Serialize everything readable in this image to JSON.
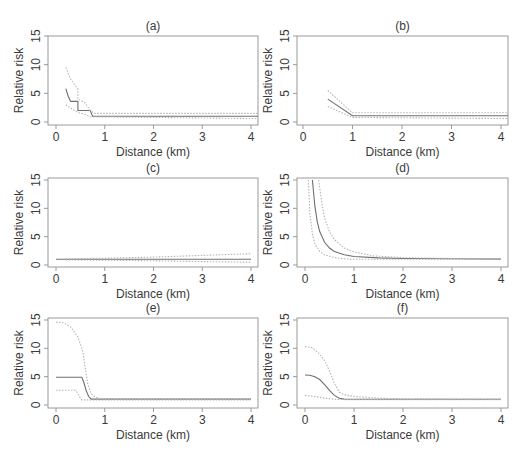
{
  "figure": {
    "xlabel": "Distance (km)",
    "ylabel": "Relative risk",
    "colors": {
      "axis": "#9a9a9a",
      "estimate": "#6f6f6f",
      "ci": "#b4b4b4",
      "text": "#3a3a3a"
    }
  },
  "chart_data": [
    {
      "panel": "(a)",
      "type": "line",
      "title": "(a)",
      "xlabel": "Distance (km)",
      "ylabel": "Relative risk",
      "xlim": [
        0,
        4
      ],
      "ylim": [
        0,
        15
      ],
      "xticks": [
        0,
        1,
        2,
        3,
        4
      ],
      "yticks": [
        0,
        5,
        10,
        15
      ],
      "grid": false,
      "series": [
        {
          "name": "estimate",
          "style": "solid",
          "x": [
            0.2,
            0.25,
            0.3,
            0.45,
            0.45,
            0.7,
            0.75,
            4.2
          ],
          "y": [
            5.8,
            4.5,
            3.6,
            3.6,
            2.0,
            2.0,
            1.0,
            1.0
          ]
        },
        {
          "name": "upper CI",
          "style": "dotted",
          "x": [
            0.2,
            0.3,
            0.45,
            0.45,
            0.6,
            0.7,
            0.8,
            4.2
          ],
          "y": [
            9.5,
            7.5,
            5.7,
            4.0,
            3.3,
            2.0,
            1.5,
            1.5
          ]
        },
        {
          "name": "lower CI",
          "style": "dotted",
          "x": [
            0.2,
            0.3,
            0.45,
            0.6,
            0.7,
            4.2
          ],
          "y": [
            3.0,
            2.4,
            1.7,
            1.3,
            0.9,
            0.6
          ]
        }
      ]
    },
    {
      "panel": "(b)",
      "type": "line",
      "title": "(b)",
      "xlabel": "Distance (km)",
      "ylabel": "Relative risk",
      "xlim": [
        0,
        4
      ],
      "ylim": [
        0,
        15
      ],
      "xticks": [
        0,
        1,
        2,
        3,
        4
      ],
      "yticks": [
        0,
        5,
        10,
        15
      ],
      "grid": false,
      "series": [
        {
          "name": "estimate",
          "style": "solid",
          "x": [
            0.5,
            1.0,
            4.2
          ],
          "y": [
            4.0,
            1.1,
            1.1
          ]
        },
        {
          "name": "upper CI",
          "style": "dotted",
          "x": [
            0.5,
            1.0,
            4.2
          ],
          "y": [
            5.5,
            1.6,
            1.6
          ]
        },
        {
          "name": "lower CI",
          "style": "dotted",
          "x": [
            0.5,
            1.0,
            4.2
          ],
          "y": [
            2.7,
            0.8,
            0.6
          ]
        }
      ]
    },
    {
      "panel": "(c)",
      "type": "line",
      "title": "(c)",
      "xlabel": "Distance (km)",
      "ylabel": "Relative risk",
      "xlim": [
        0,
        4
      ],
      "ylim": [
        0,
        15
      ],
      "xticks": [
        0,
        1,
        2,
        3,
        4
      ],
      "yticks": [
        0,
        5,
        10,
        15
      ],
      "grid": false,
      "series": [
        {
          "name": "estimate",
          "style": "solid",
          "x": [
            0,
            4
          ],
          "y": [
            1.0,
            1.0
          ]
        },
        {
          "name": "upper CI",
          "style": "dotted",
          "x": [
            0.2,
            1,
            2,
            3,
            4
          ],
          "y": [
            1.1,
            1.2,
            1.4,
            1.7,
            2.0
          ]
        },
        {
          "name": "lower CI",
          "style": "dotted",
          "x": [
            0.2,
            1,
            2,
            3,
            4
          ],
          "y": [
            0.9,
            0.85,
            0.75,
            0.6,
            0.5
          ]
        }
      ]
    },
    {
      "panel": "(d)",
      "type": "line",
      "title": "(d)",
      "xlabel": "Distance (km)",
      "ylabel": "Relative risk",
      "xlim": [
        0,
        4
      ],
      "ylim": [
        0,
        15
      ],
      "xticks": [
        0,
        1,
        2,
        3,
        4
      ],
      "yticks": [
        0,
        5,
        10,
        15
      ],
      "grid": false,
      "series": [
        {
          "name": "estimate",
          "style": "solid",
          "x": [
            0.15,
            0.2,
            0.25,
            0.3,
            0.4,
            0.5,
            0.6,
            0.8,
            1.0,
            1.5,
            2.0,
            3.0,
            4.0
          ],
          "y": [
            15,
            10.5,
            7.6,
            5.9,
            4.0,
            3.0,
            2.4,
            1.8,
            1.5,
            1.25,
            1.15,
            1.1,
            1.05
          ]
        },
        {
          "name": "upper CI",
          "style": "dotted",
          "x": [
            0.28,
            0.35,
            0.4,
            0.5,
            0.6,
            0.8,
            1.0,
            1.4,
            2.0,
            3.0,
            4.0
          ],
          "y": [
            15,
            10.5,
            8.3,
            5.9,
            4.5,
            3.0,
            2.3,
            1.6,
            1.3,
            1.15,
            1.1
          ]
        },
        {
          "name": "lower CI",
          "style": "dotted",
          "x": [
            0.07,
            0.1,
            0.15,
            0.2,
            0.3,
            0.4,
            0.6,
            0.8,
            1.0,
            1.5,
            2.0,
            4.0
          ],
          "y": [
            15,
            9.0,
            5.5,
            3.8,
            2.4,
            1.8,
            1.3,
            1.1,
            1.0,
            1.0,
            1.0,
            1.0
          ]
        }
      ]
    },
    {
      "panel": "(e)",
      "type": "line",
      "title": "(e)",
      "xlabel": "Distance (km)",
      "ylabel": "Relative risk",
      "xlim": [
        0,
        4
      ],
      "ylim": [
        0,
        15
      ],
      "xticks": [
        0,
        1,
        2,
        3,
        4
      ],
      "yticks": [
        0,
        5,
        10,
        15
      ],
      "grid": false,
      "series": [
        {
          "name": "estimate",
          "style": "solid",
          "x": [
            0,
            0.53,
            0.57,
            0.62,
            0.67,
            0.72,
            4.0
          ],
          "y": [
            4.9,
            4.9,
            4.0,
            2.5,
            1.5,
            1.05,
            1.05
          ]
        },
        {
          "name": "upper CI",
          "style": "dotted",
          "x": [
            0,
            0.15,
            0.3,
            0.45,
            0.55,
            0.6,
            0.65,
            0.72,
            0.8,
            0.9,
            1.0,
            4.0
          ],
          "y": [
            14.6,
            14.5,
            13.8,
            12.0,
            9.5,
            6.5,
            3.8,
            2.0,
            1.4,
            1.15,
            1.05,
            1.05
          ]
        },
        {
          "name": "lower CI",
          "style": "dotted",
          "x": [
            0,
            0.4,
            0.45,
            0.5,
            0.53,
            4.0
          ],
          "y": [
            2.6,
            2.6,
            2.0,
            1.2,
            0.9,
            0.9
          ]
        }
      ]
    },
    {
      "panel": "(f)",
      "type": "line",
      "title": "(f)",
      "xlabel": "Distance (km)",
      "ylabel": "Relative risk",
      "xlim": [
        0,
        4
      ],
      "ylim": [
        0,
        15
      ],
      "xticks": [
        0,
        1,
        2,
        3,
        4
      ],
      "yticks": [
        0,
        5,
        10,
        15
      ],
      "grid": false,
      "series": [
        {
          "name": "estimate",
          "style": "solid",
          "x": [
            0,
            0.1,
            0.2,
            0.3,
            0.4,
            0.5,
            0.6,
            0.7,
            0.8,
            1.0,
            4.0
          ],
          "y": [
            5.3,
            5.25,
            5.0,
            4.5,
            3.6,
            2.6,
            1.7,
            1.2,
            1.05,
            1.0,
            1.0
          ]
        },
        {
          "name": "upper CI",
          "style": "dotted",
          "x": [
            0,
            0.15,
            0.3,
            0.4,
            0.5,
            0.6,
            0.7,
            0.8,
            1.0,
            1.5,
            2.0,
            4.0
          ],
          "y": [
            10.3,
            10.1,
            9.0,
            7.8,
            6.0,
            3.8,
            2.3,
            1.8,
            1.5,
            1.2,
            1.1,
            1.05
          ]
        },
        {
          "name": "lower CI",
          "style": "dotted",
          "x": [
            0,
            0.2,
            0.4,
            0.6,
            0.8,
            1.0,
            4.0
          ],
          "y": [
            1.7,
            1.5,
            1.2,
            1.0,
            0.95,
            0.95,
            0.95
          ]
        }
      ]
    }
  ]
}
